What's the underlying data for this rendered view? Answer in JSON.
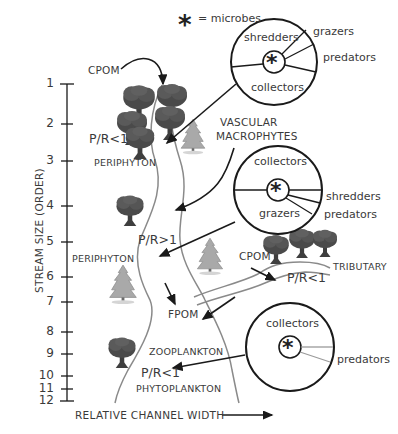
{
  "diagram": {
    "legend": {
      "symbol": "*",
      "label": "= microbes"
    },
    "y_axis": {
      "label": "STREAM SIZE (ORDER)",
      "ticks": [
        "1",
        "2",
        "3",
        "4",
        "5",
        "6",
        "7",
        "8",
        "9",
        "10",
        "11",
        "12"
      ]
    },
    "x_axis": {
      "label": "RELATIVE CHANNEL WIDTH"
    },
    "labels": {
      "cpom_top": "CPOM",
      "pr_top": "P/R<1",
      "periphyton_top": "PERIPHYTON",
      "vascular_1": "VASCULAR",
      "vascular_2": "MACROPHYTES",
      "pr_mid": "P/R>1",
      "periphyton_mid": "PERIPHYTON",
      "cpom_trib": "CPOM",
      "tributary": "TRIBUTARY",
      "pr_trib": "P/R<1",
      "fpom": "FPOM",
      "zooplankton": "ZOOPLANKTON",
      "pr_bottom": "P/R<1",
      "phytoplankton": "PHYTOPLANKTON"
    },
    "circles": [
      {
        "name": "headwaters",
        "center_symbol": "*",
        "inner": [
          "shredders",
          "collectors"
        ],
        "outer": [
          "grazers",
          "predators"
        ]
      },
      {
        "name": "midreaches",
        "center_symbol": "*",
        "inner": [
          "collectors",
          "grazers"
        ],
        "outer": [
          "shredders",
          "predators"
        ]
      },
      {
        "name": "large-river",
        "center_symbol": "*",
        "inner": [
          "collectors"
        ],
        "outer": [
          "predators"
        ]
      }
    ]
  },
  "colors": {
    "line": "#1a1a1a",
    "river": "#8a8a8a",
    "tree": "#555555",
    "pine": "#a8a8a8",
    "text": "#3a3a3a"
  }
}
